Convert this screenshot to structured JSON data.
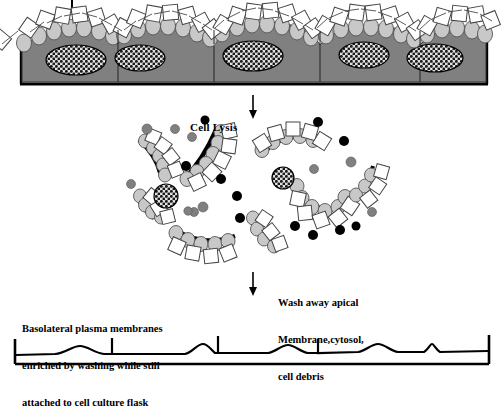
{
  "figure": {
    "title_tick_present": true,
    "annotations": {
      "cell_lysis": {
        "text": "Cell Lysis",
        "arrow": "down-arrow"
      },
      "wash_away": {
        "line1": "Wash away apical",
        "line2": "Membrane,cytosol,",
        "line3": "cell debris",
        "arrow": "down-arrow"
      },
      "basolateral": {
        "line1": "Basolateral plasma membranes",
        "line2": "enriched by washing while still",
        "line3": "attached to cell culture flask"
      }
    },
    "colors": {
      "cell_body": "#808080",
      "apical_vesicle": "#c8c8c8",
      "membrane_outline": "#000000",
      "free_dot_gray": "#808080",
      "free_dot_black": "#000000",
      "nucleus_fill": "#d9d9d9",
      "nucleus_hatch": "#000000",
      "background": "#ffffff",
      "flask_substrate": "#000000"
    },
    "panels": {
      "top": {
        "name": "intact-epithelial-monolayer",
        "cell_count": 5,
        "nucleus_count": 5,
        "description": "Confluent polarized epithelial monolayer on culture flask with apical microvilli and vesicles"
      },
      "middle": {
        "name": "lysed-cell-fragments",
        "fragment_arcs": 6,
        "free_nuclei": 2,
        "free_gray_dots": 9,
        "free_black_dots": 9,
        "description": "Apical membrane fragments, cytosol and debris released after cell lysis"
      },
      "bottom": {
        "name": "basolateral-membrane-trace",
        "description": "Flat basolateral plasma membrane sheet remaining attached to the culture flask"
      }
    }
  }
}
